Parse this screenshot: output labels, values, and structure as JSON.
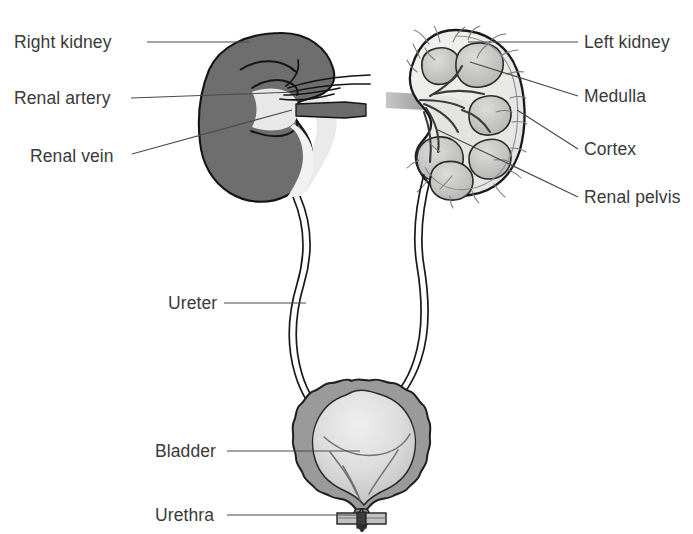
{
  "figure": {
    "background_color": "#ffffff",
    "text_color": "#3a3a3a",
    "leader_line_color": "#4a4a4a",
    "outline_color": "#1a1a1a"
  },
  "labels": {
    "right_kidney": "Right kidney",
    "renal_artery": "Renal artery",
    "renal_vein": "Renal vein",
    "left_kidney": "Left kidney",
    "medulla": "Medulla",
    "cortex": "Cortex",
    "renal_pelvis": "Renal pelvis",
    "ureter": "Ureter",
    "bladder": "Bladder",
    "urethra": "Urethra"
  },
  "annotations": [
    {
      "key": "right_kidney",
      "text": "Right kidney",
      "side": "left",
      "text_x": 14,
      "text_y": 48,
      "anchor": "start"
    },
    {
      "key": "renal_artery",
      "text": "Renal artery",
      "side": "left",
      "text_x": 14,
      "text_y": 104,
      "anchor": "start"
    },
    {
      "key": "renal_vein",
      "text": "Renal vein",
      "side": "left",
      "text_x": 30,
      "text_y": 162,
      "anchor": "start"
    },
    {
      "key": "left_kidney",
      "text": "Left kidney",
      "side": "right",
      "text_x": 584,
      "text_y": 48,
      "anchor": "start"
    },
    {
      "key": "medulla",
      "text": "Medulla",
      "side": "right",
      "text_x": 584,
      "text_y": 102,
      "anchor": "start"
    },
    {
      "key": "cortex",
      "text": "Cortex",
      "side": "right",
      "text_x": 584,
      "text_y": 155,
      "anchor": "start"
    },
    {
      "key": "renal_pelvis",
      "text": "Renal pelvis",
      "side": "right",
      "text_x": 584,
      "text_y": 203,
      "anchor": "start"
    },
    {
      "key": "ureter",
      "text": "Ureter",
      "side": "left",
      "text_x": 168,
      "text_y": 309,
      "anchor": "start"
    },
    {
      "key": "bladder",
      "text": "Bladder",
      "side": "left",
      "text_x": 155,
      "text_y": 457,
      "anchor": "start"
    },
    {
      "key": "urethra",
      "text": "Urethra",
      "side": "left",
      "text_x": 155,
      "text_y": 521,
      "anchor": "start"
    }
  ],
  "colors": {
    "right_kidney_fill": "#6e6e6e",
    "right_kidney_stroke": "#141414",
    "cortex_fill": "#ececea",
    "pyramid_fill": "#c8c8c6",
    "pelvis_fill": "#dedede",
    "bladder_wall": "#9a9a9a",
    "bladder_interior": "#d8d8d8",
    "vessel_gray": "#8a8a8a",
    "ureter_fill": "#ffffff",
    "ureter_stroke": "#1a1a1a"
  },
  "structures": {
    "right_kidney": {
      "type": "solid-bean",
      "description": "solid dark gray bean-shaped kidney, anterior view, hilum on right"
    },
    "left_kidney": {
      "type": "cross-section",
      "description": "coronal section showing cortex, medullary pyramids, renal pelvis and branching vessels",
      "pyramid_count": 7
    },
    "ureters": {
      "count": 2,
      "description": "paired double-line tubes descending with an S-curve from each kidney to the bladder"
    },
    "bladder": {
      "description": "scalloped muscular wall with lighter interior showing trigone folds"
    },
    "urethra": {
      "description": "short tube below bladder neck with sphincter bar"
    }
  }
}
